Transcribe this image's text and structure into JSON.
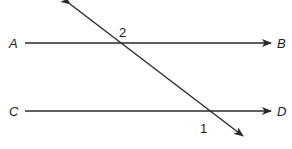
{
  "diagram": {
    "type": "parallel-lines-with-transversal",
    "stroke_color": "#2a2a2a",
    "lines": [
      {
        "id": "AB",
        "start_label": "A",
        "end_label": "B",
        "x1": 25,
        "y1": 43,
        "x2": 271,
        "y2": 43
      },
      {
        "id": "CD",
        "start_label": "C",
        "end_label": "D",
        "x1": 25,
        "y1": 111,
        "x2": 271,
        "y2": 111
      }
    ],
    "transversal": {
      "x1": 70,
      "y1": 4,
      "x2": 243,
      "y2": 136
    },
    "angle_labels": [
      {
        "id": "angle-2",
        "text": "2",
        "x": 119,
        "y": 37
      },
      {
        "id": "angle-1",
        "text": "1",
        "x": 200,
        "y": 133
      }
    ],
    "point_labels": {
      "A": "A",
      "B": "B",
      "C": "C",
      "D": "D"
    }
  }
}
